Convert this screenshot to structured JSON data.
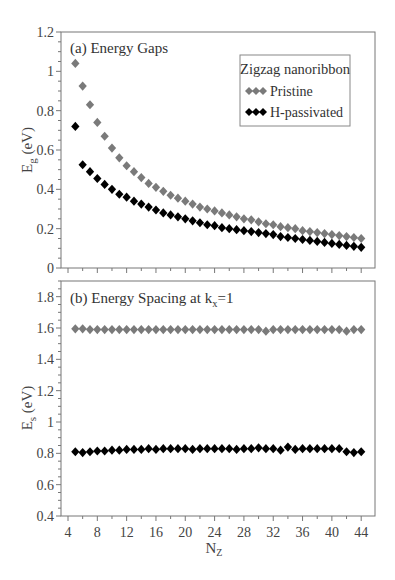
{
  "chart_data": [
    {
      "type": "scatter",
      "panel": "a",
      "title": "(a) Energy Gaps",
      "xlabel": "N_Z",
      "ylabel": "E_g (eV)",
      "xlim": [
        3,
        46
      ],
      "ylim": [
        0,
        1.2
      ],
      "xticks": [
        4,
        8,
        12,
        16,
        20,
        24,
        28,
        32,
        36,
        40,
        44
      ],
      "yticks": [
        0,
        0.2,
        0.4,
        0.6,
        0.8,
        1,
        1.2
      ],
      "ytick_labels": [
        "0",
        "0.2",
        "0.4",
        "0.6",
        "0.8",
        "1",
        "1.2"
      ],
      "show_xtick_labels": false,
      "grid": false,
      "legend": {
        "position": "upper right",
        "title": "Zigzag nanoribbon",
        "entries": [
          "Pristine",
          "H-passivated"
        ]
      },
      "series": [
        {
          "name": "Pristine",
          "color": "#7a7a7a",
          "marker": "diamond",
          "x": [
            5,
            6,
            7,
            8,
            9,
            10,
            11,
            12,
            13,
            14,
            15,
            16,
            17,
            18,
            19,
            20,
            21,
            22,
            23,
            24,
            25,
            26,
            27,
            28,
            29,
            30,
            31,
            32,
            33,
            34,
            35,
            36,
            37,
            38,
            39,
            40,
            41,
            42,
            43,
            44
          ],
          "y": [
            1.04,
            0.925,
            0.83,
            0.74,
            0.67,
            0.61,
            0.56,
            0.52,
            0.49,
            0.46,
            0.43,
            0.41,
            0.39,
            0.37,
            0.355,
            0.34,
            0.325,
            0.31,
            0.3,
            0.29,
            0.28,
            0.27,
            0.26,
            0.25,
            0.245,
            0.235,
            0.225,
            0.22,
            0.21,
            0.205,
            0.2,
            0.19,
            0.185,
            0.18,
            0.175,
            0.17,
            0.165,
            0.16,
            0.155,
            0.15
          ]
        },
        {
          "name": "H-passivated",
          "color": "#000000",
          "marker": "diamond",
          "x": [
            5,
            6,
            7,
            8,
            9,
            10,
            11,
            12,
            13,
            14,
            15,
            16,
            17,
            18,
            19,
            20,
            21,
            22,
            23,
            24,
            25,
            26,
            27,
            28,
            29,
            30,
            31,
            32,
            33,
            34,
            35,
            36,
            37,
            38,
            39,
            40,
            41,
            42,
            43,
            44
          ],
          "y": [
            0.72,
            0.525,
            0.49,
            0.455,
            0.425,
            0.4,
            0.375,
            0.36,
            0.34,
            0.325,
            0.31,
            0.295,
            0.28,
            0.27,
            0.26,
            0.25,
            0.24,
            0.23,
            0.22,
            0.215,
            0.205,
            0.2,
            0.195,
            0.19,
            0.185,
            0.18,
            0.175,
            0.17,
            0.16,
            0.155,
            0.15,
            0.145,
            0.14,
            0.135,
            0.13,
            0.125,
            0.12,
            0.115,
            0.11,
            0.105
          ]
        }
      ]
    },
    {
      "type": "scatter",
      "panel": "b",
      "title": "(b)  Energy Spacing at k_x=1",
      "xlabel": "N_Z",
      "ylabel": "E_s (eV)",
      "xlim": [
        3,
        46
      ],
      "ylim": [
        0.4,
        1.9
      ],
      "xticks": [
        4,
        8,
        12,
        16,
        20,
        24,
        28,
        32,
        36,
        40,
        44
      ],
      "xtick_labels": [
        "4",
        "8",
        "12",
        "16",
        "20",
        "24",
        "28",
        "32",
        "36",
        "40",
        "44"
      ],
      "yticks": [
        0.4,
        0.6,
        0.8,
        1,
        1.2,
        1.4,
        1.6,
        1.8
      ],
      "ytick_labels": [
        "0.4",
        "0.6",
        "0.8",
        "1",
        "1.2",
        "1.4",
        "1.6",
        "1.8"
      ],
      "grid": false,
      "series": [
        {
          "name": "Pristine",
          "color": "#7a7a7a",
          "marker": "diamond",
          "x": [
            5,
            6,
            7,
            8,
            9,
            10,
            11,
            12,
            13,
            14,
            15,
            16,
            17,
            18,
            19,
            20,
            21,
            22,
            23,
            24,
            25,
            26,
            27,
            28,
            29,
            30,
            31,
            32,
            33,
            34,
            35,
            36,
            37,
            38,
            39,
            40,
            41,
            42,
            43,
            44
          ],
          "y": [
            1.595,
            1.595,
            1.59,
            1.59,
            1.59,
            1.59,
            1.59,
            1.59,
            1.59,
            1.59,
            1.59,
            1.59,
            1.59,
            1.59,
            1.59,
            1.59,
            1.59,
            1.59,
            1.59,
            1.59,
            1.59,
            1.59,
            1.59,
            1.59,
            1.59,
            1.59,
            1.58,
            1.59,
            1.59,
            1.59,
            1.59,
            1.59,
            1.59,
            1.59,
            1.59,
            1.59,
            1.59,
            1.58,
            1.59,
            1.59
          ]
        },
        {
          "name": "H-passivated",
          "color": "#000000",
          "marker": "diamond",
          "x": [
            5,
            6,
            7,
            8,
            9,
            10,
            11,
            12,
            13,
            14,
            15,
            16,
            17,
            18,
            19,
            20,
            21,
            22,
            23,
            24,
            25,
            26,
            27,
            28,
            29,
            30,
            31,
            32,
            33,
            34,
            35,
            36,
            37,
            38,
            39,
            40,
            41,
            42,
            43,
            44
          ],
          "y": [
            0.81,
            0.805,
            0.81,
            0.815,
            0.815,
            0.82,
            0.82,
            0.825,
            0.825,
            0.825,
            0.83,
            0.825,
            0.83,
            0.83,
            0.83,
            0.83,
            0.825,
            0.83,
            0.83,
            0.83,
            0.83,
            0.83,
            0.825,
            0.83,
            0.83,
            0.835,
            0.83,
            0.83,
            0.82,
            0.84,
            0.825,
            0.83,
            0.83,
            0.83,
            0.83,
            0.83,
            0.83,
            0.81,
            0.805,
            0.81
          ]
        }
      ]
    }
  ],
  "labels": {
    "panel_a_title": "(a) Energy Gaps",
    "panel_b_title_prefix": "(b)  Energy Spacing at k",
    "panel_b_title_sub": "x",
    "panel_b_title_suffix": "=1",
    "ylabel_a_main": "E",
    "ylabel_a_sub": "g",
    "ylabel_a_unit": " (eV)",
    "ylabel_b_main": "E",
    "ylabel_b_sub": "s",
    "ylabel_b_unit": " (eV)",
    "xlabel_main": "N",
    "xlabel_sub": "Z",
    "legend_title": "Zigzag nanoribbon",
    "legend_entry_1": "Pristine",
    "legend_entry_2": "H-passivated"
  },
  "layout": {
    "plot_left": 61,
    "plot_right": 375,
    "x_unit_origin": 4,
    "x_origin_px": 68,
    "x_px_per_unit": 7.33,
    "panel_a": {
      "top": 32,
      "bottom": 268,
      "ymin": 0,
      "ymax": 1.2
    },
    "panel_b": {
      "top": 281,
      "bottom": 516,
      "ymin": 0.4,
      "ymax": 1.9
    }
  }
}
